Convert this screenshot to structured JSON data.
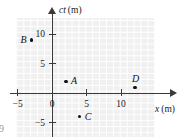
{
  "figure": {
    "kind": "spacetime-scatter-plot",
    "corner_mark": "9"
  },
  "chart_data": {
    "type": "scatter",
    "title": "",
    "xlabel": "x (m)",
    "ylabel": "ct (m)",
    "xlim": [
      -5.2,
      17.4
    ],
    "ylim": [
      -7.0,
      13.7
    ],
    "grid": true,
    "legend": false,
    "xticks": [
      -5,
      0,
      5,
      10
    ],
    "xticklabels": [
      "−5",
      "0",
      "5",
      "10"
    ],
    "yticks": [
      10,
      5,
      -5
    ],
    "yticklabels": [
      "10",
      "5",
      "−5"
    ],
    "points": [
      {
        "label": "A",
        "x": 2,
        "y": 2,
        "label_side": "right"
      },
      {
        "label": "B",
        "x": -3,
        "y": 9,
        "label_side": "left"
      },
      {
        "label": "C",
        "x": 4,
        "y": -4,
        "label_side": "right"
      },
      {
        "label": "D",
        "x": 12,
        "y": 1,
        "label_side": "above"
      }
    ]
  },
  "axes": {
    "x_name_var": "x",
    "x_name_unit": "(m)",
    "y_name_var": "ct",
    "y_name_unit": "(m)"
  },
  "colors": {
    "grid_fill": "#f0f0f0",
    "grid_line": "#ffffff",
    "axis": "#3a3a3a",
    "point": "#111111",
    "text": "#1a1a1a"
  }
}
